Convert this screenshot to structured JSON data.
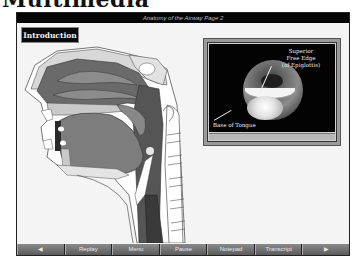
{
  "page": {
    "heading": "Multimedia"
  },
  "window": {
    "title": "Anatomy of the Airway Page 2"
  },
  "section": {
    "label": "Introduction"
  },
  "illustration": {
    "description": "sagittal-head-neck-airway-anatomy"
  },
  "video": {
    "caption_top_line1": "Superior",
    "caption_top_line2": "Free Edge",
    "caption_top_line3": "(of Epiglottis)",
    "caption_bottom": "Base of Tongue"
  },
  "nav": {
    "prev_icon": "◀",
    "replay": "Replay",
    "menu": "Menu",
    "pause": "Pause",
    "notepad": "Notepad",
    "transcript": "Transcript",
    "next_icon": "▶"
  },
  "colors": {
    "title_bar_bg": "#050505",
    "nav_bg": "#6e6e6e",
    "background": "#f4f4f4"
  }
}
